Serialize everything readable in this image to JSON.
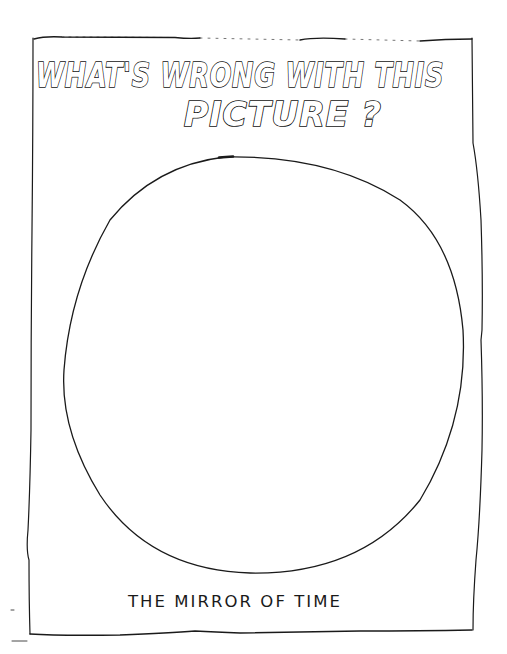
{
  "title": {
    "line1": "WHAT'S WRONG WITH THIS",
    "line2": "PICTURE ?"
  },
  "caption": "THE MIRROR OF TIME",
  "colors": {
    "ink": "#1a1a1a",
    "paper": "#ffffff"
  }
}
